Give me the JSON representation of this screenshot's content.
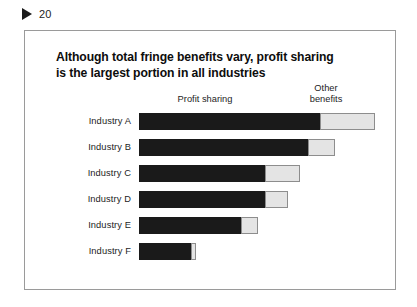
{
  "slide_marker": {
    "icon": "play-triangle-icon",
    "number": "20"
  },
  "chart_title": {
    "line1": "Although total fringe benefits vary, profit sharing",
    "line2": "is the largest portion in all industries"
  },
  "headers": {
    "profit_sharing": "Profit sharing",
    "other_benefits_line1": "Other",
    "other_benefits_line2": "benefits"
  },
  "colors": {
    "profit_sharing": "#1a1a1a",
    "other_benefits": "#e4e4e4",
    "other_benefits_border": "#8d8d8d",
    "frame_border": "#9a9a9a",
    "text": "#1d1d1d",
    "title_text": "#0d0d0d",
    "background": "#ffffff"
  },
  "chart_data": {
    "type": "bar",
    "orientation": "horizontal",
    "stacked": true,
    "title": "Although total fringe benefits vary, profit sharing is the largest portion in all industries",
    "xlabel": "",
    "ylabel": "",
    "grid": false,
    "legend_position": "top",
    "categories": [
      "Industry A",
      "Industry B",
      "Industry C",
      "Industry D",
      "Industry E",
      "Industry F"
    ],
    "series": [
      {
        "name": "Profit sharing",
        "color": "#1a1a1a",
        "values": [
          73,
          68,
          51,
          51,
          41,
          21
        ]
      },
      {
        "name": "Other benefits",
        "color": "#e4e4e4",
        "values": [
          22,
          11,
          14,
          9,
          7,
          2
        ]
      }
    ],
    "totals": [
      95,
      79,
      65,
      60,
      48,
      23
    ],
    "xlim": [
      0,
      100
    ],
    "units": "relative width (percent of plot width)"
  }
}
